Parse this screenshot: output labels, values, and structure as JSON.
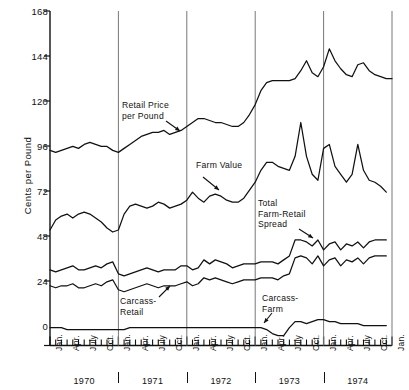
{
  "chart_data": {
    "type": "line",
    "title": "",
    "xlabel": "",
    "ylabel": "Cents per Pound",
    "ylim": [
      0,
      168
    ],
    "yticks": [
      0,
      24,
      48,
      72,
      96,
      120,
      144,
      168
    ],
    "ytick_labels": [
      "0",
      "24",
      "48",
      "72",
      "96",
      "120",
      "144",
      "168"
    ],
    "grid": false,
    "legend": "annotations-inline",
    "xlim_months": [
      0,
      60
    ],
    "x_month_labels": [
      "Jan.",
      "Apr.",
      "July",
      "Oct."
    ],
    "years": [
      "1970",
      "1971",
      "1972",
      "1973",
      "1974"
    ],
    "year_end_label": "Jan.",
    "annotations": [
      {
        "name": "retail-price-annotation",
        "text": "Retail Price\nper Pound",
        "x": 122,
        "y": 100,
        "arrow_from": [
          166,
          121
        ],
        "arrow_to": [
          180,
          131
        ]
      },
      {
        "name": "farm-value-annotation",
        "text": "Farm Value",
        "x": 196,
        "y": 160,
        "arrow_from": [
          203,
          177
        ],
        "arrow_to": [
          219,
          190
        ]
      },
      {
        "name": "total-farm-retail-spread-annotation",
        "text": "Total\nFarm-Retail\nSpread",
        "x": 258,
        "y": 198,
        "arrow_from": [
          299,
          229
        ],
        "arrow_to": [
          313,
          238
        ]
      },
      {
        "name": "carcass-retail-annotation",
        "text": "Carcass-\nRetail",
        "x": 120,
        "y": 296,
        "arrow_from": [
          159,
          297
        ],
        "arrow_to": [
          170,
          286
        ]
      },
      {
        "name": "carcass-farm-annotation",
        "text": "Carcass-\nFarm",
        "x": 262,
        "y": 293,
        "arrow_from": [
          272,
          313
        ],
        "arrow_to": [
          264,
          323
        ]
      }
    ],
    "series": [
      {
        "name": "Retail Price per Pound",
        "values": [
          98,
          97,
          98,
          99,
          100,
          99,
          101,
          102,
          101,
          100,
          100,
          98,
          97,
          99,
          101,
          103,
          105,
          106,
          107,
          107,
          108,
          106,
          107,
          108,
          110,
          112,
          114,
          114,
          113,
          112,
          112,
          111,
          110,
          110,
          112,
          116,
          121,
          128,
          132,
          133,
          133,
          133,
          133,
          134,
          138,
          143,
          137,
          135,
          140,
          149,
          143,
          139,
          136,
          135,
          141,
          142,
          138,
          136,
          135,
          134,
          134
        ]
      },
      {
        "name": "Farm Value",
        "values": [
          58,
          63,
          65,
          66,
          64,
          66,
          67,
          66,
          64,
          62,
          59,
          57,
          58,
          66,
          70,
          71,
          70,
          69,
          70,
          72,
          71,
          69,
          70,
          71,
          73,
          77,
          74,
          72,
          75,
          76,
          75,
          73,
          72,
          72,
          74,
          78,
          82,
          88,
          92,
          92,
          90,
          89,
          88,
          95,
          112,
          95,
          86,
          83,
          99,
          101,
          90,
          86,
          82,
          86,
          101,
          88,
          83,
          82,
          80,
          77
        ]
      },
      {
        "name": "Total Farm-Retail Spread",
        "values": [
          38,
          37,
          38,
          39,
          40,
          38,
          38,
          39,
          40,
          39,
          41,
          42,
          36,
          35,
          36,
          37,
          38,
          39,
          38,
          37,
          38,
          38,
          38,
          40,
          40,
          38,
          39,
          43,
          41,
          43,
          42,
          41,
          39,
          40,
          41,
          41,
          41,
          42,
          42,
          42,
          41,
          43,
          45,
          53,
          53,
          52,
          50,
          53,
          48,
          51,
          52,
          48,
          51,
          50,
          52,
          49,
          52,
          53,
          53,
          53
        ]
      },
      {
        "name": "Carcass-Retail",
        "values": [
          30,
          29,
          30,
          30,
          31,
          29,
          29,
          30,
          31,
          30,
          32,
          33,
          28,
          27,
          28,
          29,
          30,
          31,
          30,
          29,
          30,
          30,
          30,
          31,
          32,
          30,
          31,
          34,
          33,
          34,
          33,
          32,
          31,
          32,
          33,
          33,
          33,
          34,
          34,
          34,
          33,
          35,
          36,
          44,
          45,
          44,
          41,
          45,
          40,
          43,
          44,
          40,
          43,
          42,
          44,
          41,
          44,
          45,
          45,
          45
        ]
      },
      {
        "name": "Carcass-Farm",
        "values": [
          9,
          9,
          9,
          8,
          8,
          8,
          8,
          8,
          8,
          8,
          8,
          8,
          8,
          8,
          9,
          9,
          9,
          9,
          9,
          9,
          9,
          9,
          9,
          9,
          9,
          9,
          9,
          9,
          9,
          9,
          9,
          9,
          9,
          9,
          9,
          9,
          9,
          9,
          8,
          6,
          5,
          5,
          9,
          12,
          12,
          11,
          12,
          13,
          13,
          12,
          12,
          11,
          11,
          11,
          11,
          10,
          10,
          10,
          10,
          10
        ]
      }
    ]
  },
  "axis": {
    "ylabel": "Cents per Pound",
    "ytick_labels": [
      "168",
      "144",
      "120",
      "96",
      "72",
      "48",
      "24",
      "0"
    ],
    "month_labels": [
      "Jan.",
      "Apr.",
      "July",
      "Oct."
    ],
    "year_labels": [
      "1970",
      "1971",
      "1972",
      "1973",
      "1974"
    ],
    "final_month_label": "Jan."
  },
  "colors": {
    "line": "#111111",
    "axis": "#111111",
    "background": "#ffffff"
  }
}
